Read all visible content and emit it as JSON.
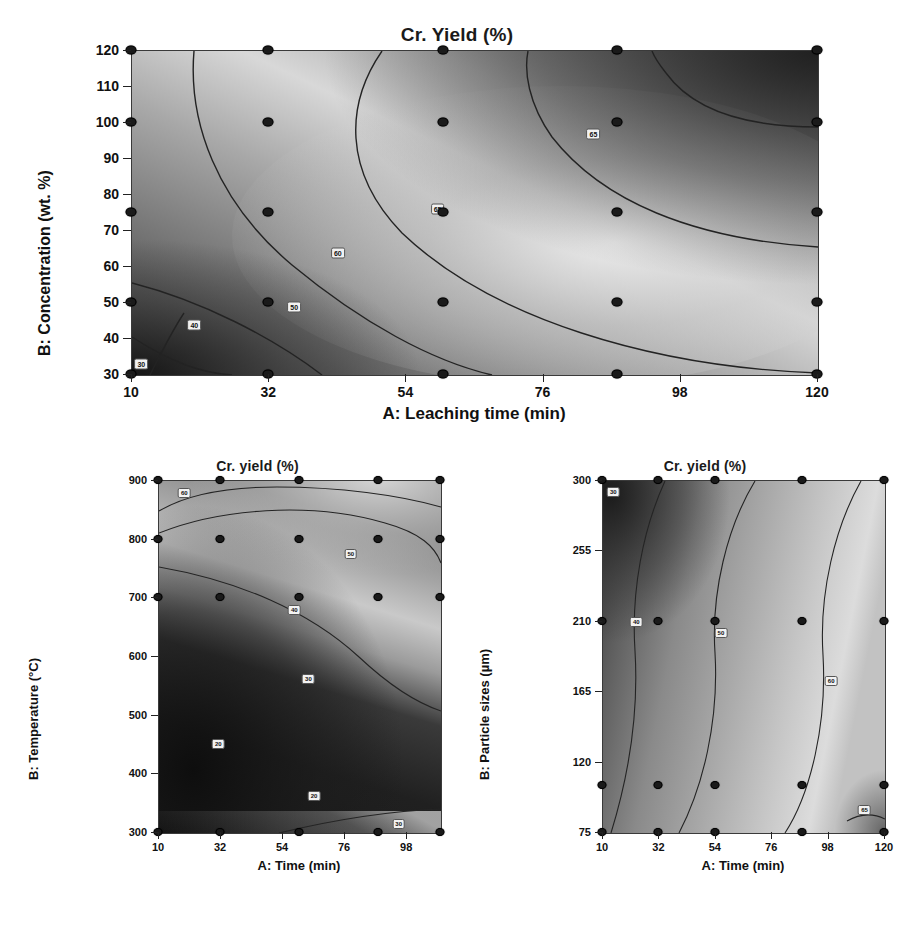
{
  "figure": {
    "panels": [
      "panelA",
      "panelB",
      "panelC"
    ]
  },
  "chart_data": [
    {
      "id": "panelA",
      "type": "heatmap",
      "title": "Cr. Yield (%)",
      "xlabel": "A: Leaching time (min)",
      "ylabel": "B: Concentration (wt. %)",
      "xlim": [
        10,
        120
      ],
      "ylim": [
        30,
        120
      ],
      "xticks": [
        10,
        32,
        54,
        76,
        98,
        120
      ],
      "yticks": [
        30,
        40,
        50,
        60,
        70,
        80,
        90,
        100,
        110,
        120
      ],
      "grid": false,
      "legend": "none",
      "colormap": "grayscale-dark-to-light",
      "contour_levels": [
        30,
        40,
        50,
        60,
        65
      ],
      "contour_labels": [
        {
          "value": "30",
          "x": 11.5,
          "y": 33
        },
        {
          "value": "40",
          "x": 20.0,
          "y": 44
        },
        {
          "value": "50",
          "x": 36.0,
          "y": 49
        },
        {
          "value": "60",
          "x": 43.0,
          "y": 64
        },
        {
          "value": "65",
          "x": 59.0,
          "y": 76
        },
        {
          "value": "65",
          "x": 84.0,
          "y": 97
        }
      ],
      "design_points_x": [
        10,
        32,
        60,
        88,
        120
      ],
      "design_points_y": [
        30,
        50,
        75,
        100,
        120
      ],
      "notes": "Response surface of Cr. yield vs leaching time and acid concentration; maximum yield along a broad diagonal ridge, minimum at low time / low concentration corner."
    },
    {
      "id": "panelB",
      "type": "heatmap",
      "title": "Cr. yield (%)",
      "xlabel": "A: Time (min)",
      "ylabel": "B: Temperature (°C)",
      "xlim": [
        10,
        110
      ],
      "ylim": [
        300,
        900
      ],
      "xticks": [
        10,
        32,
        54,
        76,
        98
      ],
      "yticks": [
        300,
        400,
        500,
        600,
        700,
        800,
        900
      ],
      "grid": false,
      "legend": "none",
      "colormap": "grayscale-dark-to-light",
      "contour_levels": [
        20,
        30,
        40,
        50,
        60
      ],
      "contour_labels": [
        {
          "value": "60",
          "x": 19,
          "y": 880
        },
        {
          "value": "50",
          "x": 78,
          "y": 775
        },
        {
          "value": "40",
          "x": 58,
          "y": 680
        },
        {
          "value": "30",
          "x": 63,
          "y": 562
        },
        {
          "value": "20",
          "x": 31,
          "y": 452
        },
        {
          "value": "20",
          "x": 65,
          "y": 363
        },
        {
          "value": "30",
          "x": 95,
          "y": 315
        }
      ],
      "design_points_x": [
        10,
        32,
        60,
        88,
        110
      ],
      "design_points_y": [
        300,
        700,
        800,
        900
      ],
      "notes": "Cr. yield rises with roasting temperature; dark low-yield region occupies the lower two thirds of the temperature range."
    },
    {
      "id": "panelC",
      "type": "heatmap",
      "title": "Cr. yield (%)",
      "xlabel": "A: Time (min)",
      "ylabel": "B: Particle sizes (µm)",
      "xlim": [
        10,
        120
      ],
      "ylim": [
        75,
        300
      ],
      "xticks": [
        10,
        32,
        54,
        76,
        98,
        120
      ],
      "yticks": [
        75,
        120,
        165,
        210,
        255,
        300
      ],
      "grid": false,
      "legend": "none",
      "colormap": "grayscale-dark-to-light",
      "contour_levels": [
        30,
        40,
        50,
        60,
        65
      ],
      "contour_labels": [
        {
          "value": "30",
          "x": 14,
          "y": 293
        },
        {
          "value": "40",
          "x": 23,
          "y": 210
        },
        {
          "value": "50",
          "x": 56,
          "y": 203
        },
        {
          "value": "60",
          "x": 99,
          "y": 172
        },
        {
          "value": "65",
          "x": 112,
          "y": 90
        }
      ],
      "design_points_x": [
        10,
        32,
        54,
        88,
        120
      ],
      "design_points_y": [
        75,
        105,
        210,
        300
      ],
      "notes": "Cr. yield increases with leaching time; smaller particle sizes at long times give the highest yields."
    }
  ]
}
